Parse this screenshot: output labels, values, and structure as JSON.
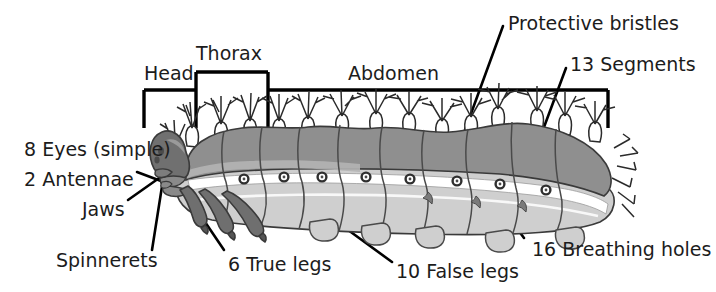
{
  "figure": {
    "background_color": "#ffffff",
    "text_color": "#1c1c1c",
    "line_color": "#000000"
  },
  "palette": {
    "dorsal_body": "#8f8f8f",
    "ventral_body": "#cfcfcf",
    "mid_band": "#b4b4b4",
    "head_dark": "#707070",
    "legs_dark": "#6f6f6f",
    "white_stripe": "#ffffff",
    "outline": "#2b2b2b",
    "bristle": "#ffffff"
  },
  "brackets": {
    "head": {
      "label": "Head",
      "x": 144,
      "y": 64
    },
    "thorax": {
      "label": "Thorax",
      "x": 196,
      "y": 44
    },
    "abdomen": {
      "label": "Abdomen",
      "x": 348,
      "y": 64
    }
  },
  "labels": [
    {
      "id": "protective-bristles",
      "text": "Protective bristles",
      "x": 508,
      "y": 14
    },
    {
      "id": "segments",
      "text": "13 Segments",
      "x": 570,
      "y": 55
    },
    {
      "id": "eyes",
      "text": "8 Eyes (simple)",
      "x": 24,
      "y": 140
    },
    {
      "id": "antennae",
      "text": "2 Antennae",
      "x": 24,
      "y": 170
    },
    {
      "id": "jaws",
      "text": "Jaws",
      "x": 82,
      "y": 200
    },
    {
      "id": "spinnerets",
      "text": "Spinnerets",
      "x": 56,
      "y": 251
    },
    {
      "id": "true-legs",
      "text": "6 True legs",
      "x": 228,
      "y": 255
    },
    {
      "id": "false-legs",
      "text": "10 False legs",
      "x": 396,
      "y": 262
    },
    {
      "id": "breathing-holes",
      "text": "16 Breathing holes",
      "x": 532,
      "y": 240
    }
  ],
  "anatomy": {
    "spiracle_count_visible": 8,
    "segment_divisions_visible": 9,
    "true_legs_visible": 3,
    "false_legs_visible": 4,
    "bristle_tufts_visible": 14,
    "body_extent_px": {
      "x1": 152,
      "x2": 618,
      "y1": 118,
      "y2": 232
    }
  }
}
